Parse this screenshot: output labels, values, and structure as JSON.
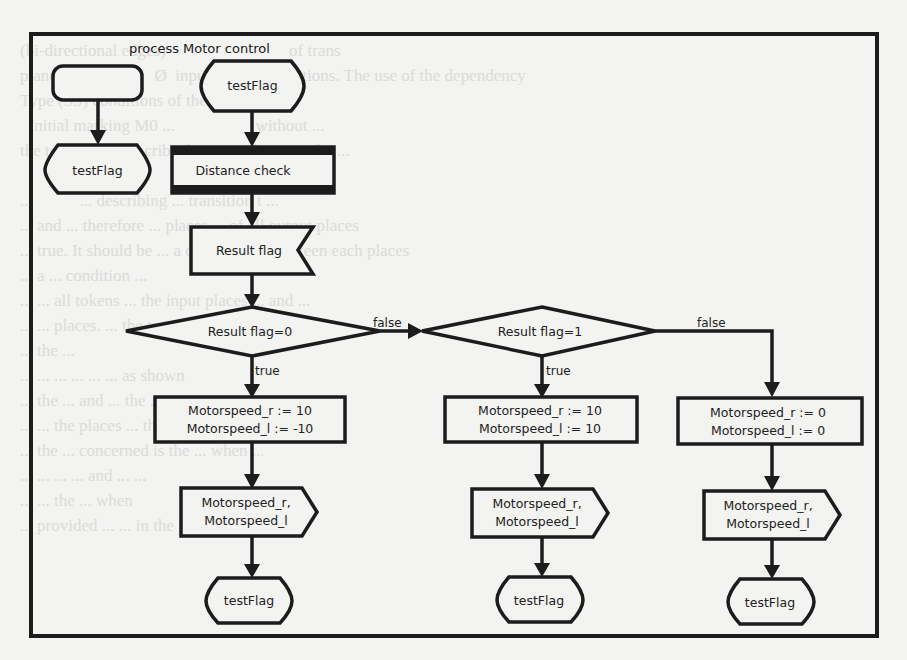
{
  "diagram": {
    "title": "process Motor control",
    "colors": {
      "stroke": "#1c1c1c",
      "fill": "#f3f3f1",
      "text": "#222222"
    },
    "nodes": {
      "start_left": {
        "type": "start",
        "label": ""
      },
      "terminator_left": {
        "type": "state",
        "label": "testFlag"
      },
      "start_main": {
        "type": "state",
        "label": "testFlag"
      },
      "distance_check": {
        "type": "procedure-call",
        "label": "Distance check"
      },
      "result_flag_input": {
        "type": "input-signal",
        "label": "Result  flag"
      },
      "decision_0": {
        "type": "decision",
        "label": "Result  flag=0"
      },
      "decision_1": {
        "type": "decision",
        "label": "Result  flag=1"
      },
      "task_true0": {
        "type": "task",
        "line1": "Motorspeed_r := 10",
        "line2": "Motorspeed_l := -10"
      },
      "task_true1": {
        "type": "task",
        "line1": "Motorspeed_r := 10",
        "line2": "Motorspeed_l := 10"
      },
      "task_false": {
        "type": "task",
        "line1": "Motorspeed_r := 0",
        "line2": "Motorspeed_l := 0"
      },
      "output_true0": {
        "type": "output-signal",
        "line1": "Motorspeed_r,",
        "line2": "Motorspeed_l"
      },
      "output_true1": {
        "type": "output-signal",
        "line1": "Motorspeed_r,",
        "line2": "Motorspeed_l"
      },
      "output_false": {
        "type": "output-signal",
        "line1": "Motorspeed_r,",
        "line2": "Motorspeed_l"
      },
      "end_true0": {
        "type": "state",
        "label": "testFlag"
      },
      "end_true1": {
        "type": "state",
        "label": "testFlag"
      },
      "end_false": {
        "type": "state",
        "label": "testFlag"
      }
    },
    "edge_labels": {
      "d0_false": "false",
      "d0_true": "true",
      "d1_false": "false",
      "d1_true": "true"
    }
  },
  "background_text": "(bi-directional edges)                             of trans\nplane                       Ø  input arcs of transitions. The use of the dependency\nType (SS) conditions of the transitions\n  Initial marking M0 ...                   without ...\nthe token in ... describe the state of ... at ... the ...\n\n...           ... describing ... transition t ...\n... and ... therefore ... places ... of all output places\n... true. It should be ... a condition ... between each places\n... a ... condition ...\n... ... all tokens ... the input places ... and ...\n... ... places. ... the transition of the ... system ...\n... the ...\n... ... ... ... ... ... as shown\n... the ... and ... the ...\n... ... the places ... the ...\n... the ... concerned is the ... when ...\n... ... ... ... and ... ...\n... ... the ... when\n... provided ... ... in the places ... instance"
}
